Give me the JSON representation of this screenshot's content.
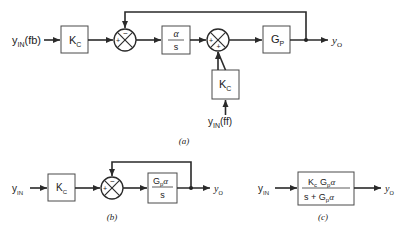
{
  "diagram_a": {
    "caption": "(a)",
    "input_fb": {
      "main": "y",
      "sub": "IN",
      "suffix": "(fb)"
    },
    "input_ff": {
      "main": "y",
      "sub": "IN",
      "suffix": "(ff)"
    },
    "block_kc1": {
      "main": "K",
      "sub": "C"
    },
    "block_alpha_s": {
      "num": "α",
      "den": "s"
    },
    "block_kc2": {
      "main": "K",
      "sub": "C"
    },
    "block_gp": {
      "main": "G",
      "sub": "P"
    },
    "sum1": {
      "signs": [
        "+",
        "−"
      ]
    },
    "sum2": {
      "signs": [
        "+",
        "+"
      ]
    },
    "output": {
      "main": "y",
      "sub": "O"
    }
  },
  "diagram_b": {
    "caption": "(b)",
    "input": {
      "main": "y",
      "sub": "IN"
    },
    "block_kc": {
      "main": "K",
      "sub": "C"
    },
    "block_tf": {
      "num_main": "G",
      "num_sub": "p",
      "num_tail": "α",
      "den": "s"
    },
    "sum": {
      "signs": [
        "+",
        "−"
      ]
    },
    "output": {
      "main": "y",
      "sub": "O"
    }
  },
  "diagram_c": {
    "caption": "(c)",
    "input": {
      "main": "y",
      "sub": "IN"
    },
    "block_tf": {
      "num": {
        "k": "K",
        "k_sub": "c",
        "g": "G",
        "g_sub": "p",
        "tail": "α"
      },
      "den": {
        "s": "s + ",
        "g": "G",
        "g_sub": "p",
        "tail": "α"
      }
    },
    "output": {
      "main": "y",
      "sub": "O"
    }
  }
}
